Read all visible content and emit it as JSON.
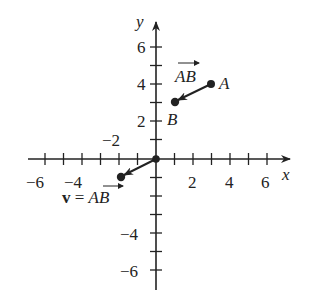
{
  "figure": {
    "axes": {
      "x_label": "x",
      "y_label": "y",
      "x_tick_labels": [
        "−6",
        "−4",
        "2",
        "4",
        "6"
      ],
      "y_tick_labels": [
        "6",
        "4",
        "2",
        "−2",
        "−4",
        "−6"
      ],
      "range": [
        -7,
        7
      ]
    },
    "points": {
      "A": {
        "label": "A",
        "x": 3,
        "y": 4
      },
      "B": {
        "label": "B",
        "x": 1,
        "y": 3
      }
    },
    "vectors": {
      "ab_label": "AB",
      "v_prefix": "v",
      "v_equals": " = ",
      "v_label": "AB",
      "v_tail": [
        0,
        0
      ],
      "v_head": [
        -2,
        -1
      ]
    },
    "colors": {
      "ink": "#222222",
      "background": "#ffffff"
    }
  }
}
